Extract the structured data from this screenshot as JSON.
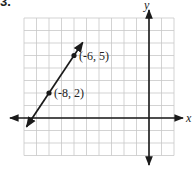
{
  "problem": {
    "number_label": "3."
  },
  "chart_data": {
    "type": "line",
    "title": "",
    "xlabel": "x",
    "ylabel": "y",
    "xlim": [
      -10,
      2
    ],
    "ylim": [
      -3,
      8
    ],
    "grid": true,
    "points": [
      {
        "x": -6,
        "y": 5,
        "label": "(-6, 5)"
      },
      {
        "x": -8,
        "y": 2,
        "label": "(-8, 2)"
      }
    ],
    "line": {
      "through": [
        [
          -8,
          2
        ],
        [
          -6,
          5
        ]
      ],
      "slope": 1.5,
      "arrows": "both"
    }
  },
  "colors": {
    "grid": "#c8c8c8",
    "axis": "#1a1a1a",
    "line": "#1a1a1a"
  }
}
